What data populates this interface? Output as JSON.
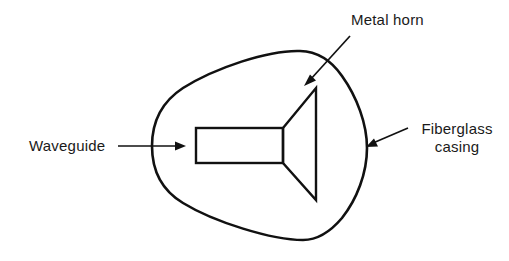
{
  "figure": {
    "kind": "cross-section-diagram",
    "background_color": "#ffffff",
    "stroke_color": "#111111"
  },
  "labels": {
    "waveguide": {
      "text": "Waveguide",
      "leader": "horizontal-arrow-right"
    },
    "metal_horn": {
      "text": "Metal horn",
      "leader": "diagonal-arrow-down-left"
    },
    "fiberglass": {
      "line1": "Fiberglass",
      "line2": "casing",
      "leader": "diagonal-arrow-down-left"
    }
  },
  "parts": {
    "casing": {
      "name": "Fiberglass casing",
      "shape": "rounded teardrop outline",
      "stroke_width": 2.6
    },
    "horn": {
      "name": "Metal horn",
      "shape": "flared trapezoid opening right",
      "stroke_width": 2.4
    },
    "waveguide": {
      "name": "Waveguide",
      "shape": "rectangle",
      "stroke_width": 2.4
    }
  }
}
